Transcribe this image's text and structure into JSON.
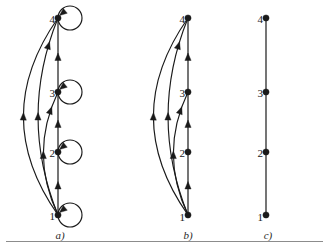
{
  "figure": {
    "type": "diagram",
    "background_color": "#ffffff",
    "stroke_color": "#1a1a1a",
    "rule_color": "#8c8c8c",
    "panels": [
      {
        "id": "a",
        "caption": "a)",
        "caption_x": 50,
        "caption_y": 229,
        "spine_x": 58,
        "nodes": [
          {
            "label": "1",
            "x": 58,
            "y": 215,
            "label_x": 41,
            "label_y": 210,
            "self_loop": true
          },
          {
            "label": "2",
            "x": 58,
            "y": 152,
            "label_x": 41,
            "label_y": 147,
            "self_loop": true
          },
          {
            "label": "3",
            "x": 58,
            "y": 92,
            "label_x": 41,
            "label_y": 87,
            "self_loop": true
          },
          {
            "label": "4",
            "x": 58,
            "y": 18,
            "label_x": 41,
            "label_y": 13,
            "self_loop": true
          }
        ],
        "spine_edges": [
          {
            "from": "1",
            "to": "2"
          },
          {
            "from": "2",
            "to": "3"
          },
          {
            "from": "3",
            "to": "4"
          }
        ],
        "arc_edges": [
          {
            "from": "1",
            "to": "4",
            "bulge": 52
          },
          {
            "from": "1",
            "to": "4",
            "bulge": 30
          },
          {
            "from": "1",
            "to": "3",
            "bulge": 22
          }
        ],
        "self_loop_radius": 12
      },
      {
        "id": "b",
        "caption": "b)",
        "caption_x": 178,
        "caption_y": 229,
        "spine_x": 188,
        "nodes": [
          {
            "label": "1",
            "x": 188,
            "y": 215,
            "label_x": 171,
            "label_y": 211,
            "self_loop": false
          },
          {
            "label": "2",
            "x": 188,
            "y": 152,
            "label_x": 171,
            "label_y": 147,
            "self_loop": false
          },
          {
            "label": "3",
            "x": 188,
            "y": 92,
            "label_x": 171,
            "label_y": 87,
            "self_loop": false
          },
          {
            "label": "4",
            "x": 188,
            "y": 18,
            "label_x": 171,
            "label_y": 13,
            "self_loop": false
          }
        ],
        "spine_edges": [
          {
            "from": "1",
            "to": "2"
          },
          {
            "from": "2",
            "to": "3"
          },
          {
            "from": "3",
            "to": "4"
          }
        ],
        "arc_edges": [
          {
            "from": "1",
            "to": "4",
            "bulge": 52
          },
          {
            "from": "1",
            "to": "4",
            "bulge": 30
          },
          {
            "from": "1",
            "to": "3",
            "bulge": 22
          }
        ],
        "self_loop_radius": 0
      },
      {
        "id": "c",
        "caption": "c)",
        "caption_x": 258,
        "caption_y": 229,
        "spine_x": 266,
        "nodes": [
          {
            "label": "1",
            "x": 266,
            "y": 215,
            "label_x": 249,
            "label_y": 211,
            "self_loop": false
          },
          {
            "label": "2",
            "x": 266,
            "y": 152,
            "label_x": 249,
            "label_y": 147,
            "self_loop": false
          },
          {
            "label": "3",
            "x": 266,
            "y": 92,
            "label_x": 249,
            "label_y": 87,
            "self_loop": false
          },
          {
            "label": "4",
            "x": 266,
            "y": 18,
            "label_x": 249,
            "label_y": 13,
            "self_loop": false
          }
        ],
        "spine_edges": [
          {
            "from": "1",
            "to": "2",
            "directed": false
          },
          {
            "from": "2",
            "to": "3",
            "directed": false
          },
          {
            "from": "3",
            "to": "4",
            "directed": false
          }
        ],
        "arc_edges": [],
        "self_loop_radius": 0
      }
    ],
    "bottom_rule": true
  }
}
